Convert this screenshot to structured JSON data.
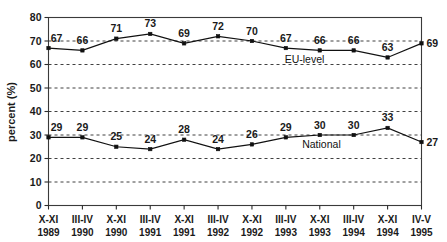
{
  "chart_data": {
    "type": "line",
    "title": "",
    "xlabel": "",
    "ylabel": "percent (%)",
    "ylim": [
      0,
      80
    ],
    "yticks": [
      0,
      10,
      20,
      30,
      40,
      50,
      60,
      70,
      80
    ],
    "grid": true,
    "legend_position": "inline-labels",
    "categories": [
      "X-XI\n1989",
      "III-IV\n1990",
      "X-XI\n1990",
      "III-IV\n1991",
      "X-XI\n1991",
      "III-IV\n1992",
      "X-XI\n1992",
      "III-IV\n1993",
      "X-XI\n1993",
      "III-IV\n1994",
      "X-XI\n1994",
      "IV-V\n1995"
    ],
    "x_tick_lines": [
      {
        "period": "X-XI",
        "year": "1989"
      },
      {
        "period": "III-IV",
        "year": "1990"
      },
      {
        "period": "X-XI",
        "year": "1990"
      },
      {
        "period": "III-IV",
        "year": "1991"
      },
      {
        "period": "X-XI",
        "year": "1991"
      },
      {
        "period": "III-IV",
        "year": "1992"
      },
      {
        "period": "X-XI",
        "year": "1992"
      },
      {
        "period": "III-IV",
        "year": "1993"
      },
      {
        "period": "X-XI",
        "year": "1993"
      },
      {
        "period": "III-IV",
        "year": "1994"
      },
      {
        "period": "X-XI",
        "year": "1994"
      },
      {
        "period": "IV-V",
        "year": "1995"
      }
    ],
    "series": [
      {
        "name": "EU-level",
        "values": [
          67,
          66,
          71,
          73,
          69,
          72,
          70,
          67,
          66,
          66,
          63,
          69
        ]
      },
      {
        "name": "National",
        "values": [
          29,
          29,
          25,
          24,
          28,
          24,
          26,
          29,
          30,
          30,
          33,
          27
        ]
      }
    ]
  },
  "colors": {
    "line": "#111111",
    "grid": "#2b2b2b",
    "frame": "#3a3a3a",
    "text": "#1a1a1a",
    "background": "#ffffff"
  }
}
